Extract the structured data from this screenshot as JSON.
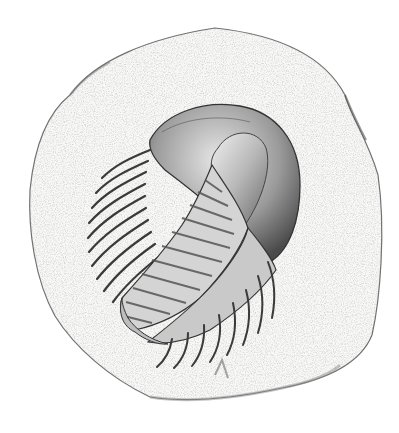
{
  "image": {
    "subject": "Pencil drawing of a trilobite fossil on a rock slab",
    "colors": {
      "background": "#ffffff",
      "rock_fill": "#f7f7f6",
      "rock_outline": "#6e6e6e",
      "shell_dark": "#3c3c3c",
      "shell_mid": "#8a8a8a",
      "shell_light": "#d8d8d8"
    },
    "parts": {
      "rock": "rock-slab",
      "cephalon": "trilobite-head-shield",
      "glabella": "trilobite-glabella",
      "thorax": "trilobite-thorax-segments",
      "pygidium": "trilobite-tail"
    },
    "thorax_segment_count": 14
  }
}
